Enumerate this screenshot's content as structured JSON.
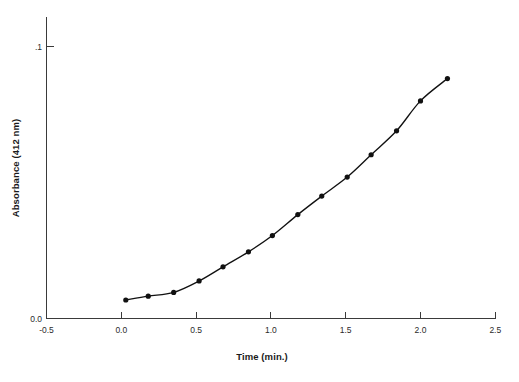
{
  "chart_data": {
    "type": "line",
    "title": "",
    "xlabel": "Time (min.)",
    "ylabel": "Absorbance (412 nm)",
    "xlim": [
      -0.5,
      2.5
    ],
    "ylim": [
      0.0,
      0.1
    ],
    "xticks": [
      "-0.5",
      "0.0",
      "0.5",
      "1.0",
      "1.5",
      "2.0",
      "2.5"
    ],
    "xtick_values": [
      -0.5,
      0.0,
      0.5,
      1.0,
      1.5,
      2.0,
      2.5
    ],
    "yticks": [
      "0.0",
      ".1"
    ],
    "ytick_values": [
      0.0,
      0.1
    ],
    "grid": false,
    "legend": false,
    "marker": "filled-circle",
    "marker_color": "#111111",
    "line_color": "#111111",
    "x": [
      0.03,
      0.18,
      0.35,
      0.52,
      0.68,
      0.85,
      1.01,
      1.18,
      1.34,
      1.51,
      1.67,
      1.84,
      2.0,
      2.18
    ],
    "y": [
      0.0068,
      0.0082,
      0.0096,
      0.0138,
      0.019,
      0.0245,
      0.0305,
      0.0382,
      0.045,
      0.052,
      0.0602,
      0.069,
      0.08,
      0.0882
    ],
    "points": [
      {
        "x": 0.03,
        "y": 0.0068
      },
      {
        "x": 0.18,
        "y": 0.0082
      },
      {
        "x": 0.35,
        "y": 0.0096
      },
      {
        "x": 0.52,
        "y": 0.0138
      },
      {
        "x": 0.68,
        "y": 0.019
      },
      {
        "x": 0.85,
        "y": 0.0245
      },
      {
        "x": 1.01,
        "y": 0.0305
      },
      {
        "x": 1.18,
        "y": 0.0382
      },
      {
        "x": 1.34,
        "y": 0.045
      },
      {
        "x": 1.51,
        "y": 0.052
      },
      {
        "x": 1.67,
        "y": 0.0602
      },
      {
        "x": 1.84,
        "y": 0.069
      },
      {
        "x": 2.0,
        "y": 0.08
      },
      {
        "x": 2.18,
        "y": 0.0882
      }
    ]
  },
  "axes": {
    "x_title": "Time (min.)",
    "y_title": "Absorbance (412 nm)",
    "x_tick_labels": [
      "-0.5",
      "0.0",
      "0.5",
      "1.0",
      "1.5",
      "2.0",
      "2.5"
    ],
    "y_tick_labels": [
      "0.0",
      ".1"
    ],
    "axis_color": "#3a3a3a"
  },
  "colors": {
    "background": "#ffffff",
    "ink": "#111111",
    "axis": "#3a3a3a",
    "text": "#2b2b2b"
  }
}
